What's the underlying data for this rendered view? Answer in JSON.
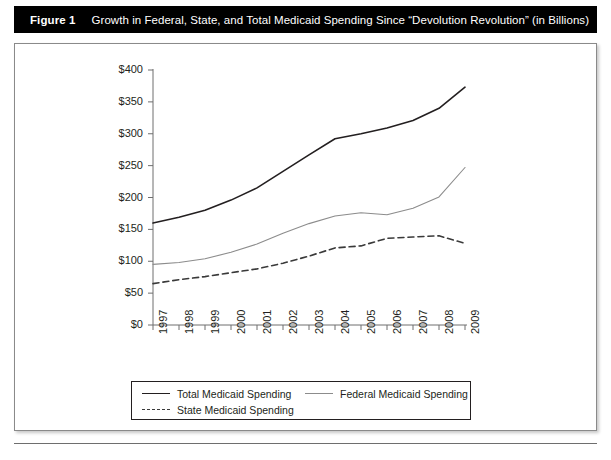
{
  "figure": {
    "label": "Figure 1",
    "caption": "Growth in Federal, State, and Total Medicaid Spending Since “Devolution Revolution” (in Billions)"
  },
  "colors": {
    "title_bar_bg": "#000000",
    "title_bar_fg": "#ffffff",
    "total_line": "#231f20",
    "federal_line": "#8c8c8c",
    "state_line": "#3a3a3a",
    "axis": "#6e6e6e",
    "frame": "#8a8a8a"
  },
  "legend": {
    "items": [
      {
        "label": "Total Medicaid Spending",
        "style": "solid-dark"
      },
      {
        "label": "Federal Medicaid Spending",
        "style": "solid-gray"
      },
      {
        "label": "State Medicaid Spending",
        "style": "dashed"
      }
    ]
  },
  "footer": {
    "ghost_text": ""
  },
  "chart_data": {
    "type": "line",
    "title": "Growth in Federal, State, and Total Medicaid Spending Since “Devolution Revolution” (in Billions)",
    "xlabel": "",
    "ylabel": "",
    "grid": false,
    "legend_position": "bottom",
    "x": [
      1997,
      1998,
      1999,
      2000,
      2001,
      2002,
      2003,
      2004,
      2005,
      2006,
      2007,
      2008,
      2009
    ],
    "xtick_labels": [
      "1997",
      "1998",
      "1999",
      "2000",
      "2001",
      "2002",
      "2003",
      "2004",
      "2005",
      "2006",
      "2007",
      "2008",
      "2009"
    ],
    "ylim": [
      0,
      400
    ],
    "ytick_values": [
      0,
      50,
      100,
      150,
      200,
      250,
      300,
      350,
      400
    ],
    "ytick_labels": [
      "$0",
      "$50",
      "$100",
      "$150",
      "$200",
      "$250",
      "$300",
      "$350",
      "$400"
    ],
    "series": [
      {
        "name": "Total Medicaid Spending",
        "style": "solid-dark",
        "color": "#231f20",
        "values": [
          160,
          169,
          180,
          196,
          215,
          241,
          267,
          292,
          300,
          309,
          321,
          340,
          373
        ]
      },
      {
        "name": "Federal Medicaid Spending",
        "style": "solid-gray",
        "color": "#8c8c8c",
        "values": [
          95,
          98,
          104,
          114,
          127,
          144,
          159,
          171,
          176,
          173,
          183,
          201,
          247
        ]
      },
      {
        "name": "State Medicaid Spending",
        "style": "dashed",
        "color": "#3a3a3a",
        "values": [
          65,
          71,
          76,
          82,
          88,
          97,
          108,
          121,
          124,
          136,
          138,
          140,
          128
        ]
      }
    ]
  }
}
